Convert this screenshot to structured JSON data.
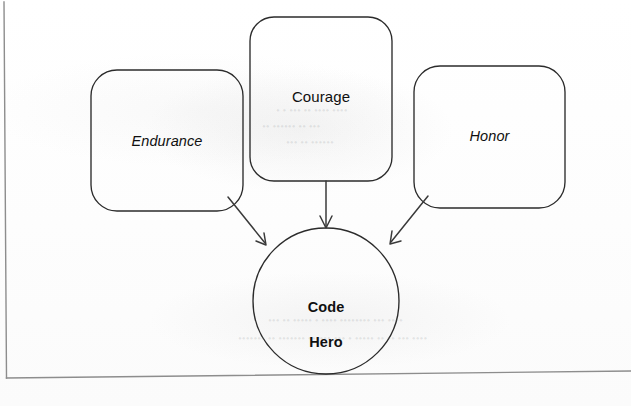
{
  "page": {
    "kind": "scanned-book-figure",
    "width": 631,
    "height": 406,
    "background_color": "#fefefe",
    "ink_color": "#2b2b2b",
    "text_color": "#101010"
  },
  "diagram": {
    "type": "concept-map",
    "title": "",
    "nodes": [
      {
        "id": "endurance",
        "label": "Endurance",
        "shape": "rounded-rectangle",
        "style": "italic",
        "x": 91,
        "y": 70,
        "width": 152,
        "height": 141
      },
      {
        "id": "courage",
        "label": "Courage",
        "shape": "rounded-rectangle",
        "style": "regular",
        "x": 250,
        "y": 17,
        "width": 142,
        "height": 164
      },
      {
        "id": "honor",
        "label": "Honor",
        "shape": "rounded-rectangle",
        "style": "italic",
        "x": 414,
        "y": 66,
        "width": 151,
        "height": 142
      },
      {
        "id": "code-hero",
        "label": "Code\nHero",
        "label_line_1": "Code",
        "label_line_2": "Hero",
        "shape": "circle",
        "style": "bold",
        "cx": 326,
        "cy": 301,
        "r": 73
      }
    ],
    "edges": [
      {
        "id": "endurance-to-code-hero",
        "from": "endurance",
        "to": "code-hero",
        "arrowhead": "open-v",
        "direction": "down-right"
      },
      {
        "id": "courage-to-code-hero",
        "from": "courage",
        "to": "code-hero",
        "arrowhead": "open-v",
        "direction": "down"
      },
      {
        "id": "honor-to-code-hero",
        "from": "honor",
        "to": "code-hero",
        "arrowhead": "open-v",
        "direction": "down-left"
      }
    ],
    "border": {
      "left_rule": true,
      "bottom_rule": true
    }
  },
  "bleed_through": [
    {
      "text": "• • ••• •• •••• ••••",
      "x": 276,
      "y": 112
    },
    {
      "text": "•• •••••• •• •••",
      "x": 262,
      "y": 128
    },
    {
      "text": "••• •• ••••••",
      "x": 286,
      "y": 144
    },
    {
      "text": "••• •• ••••• • •••• •••••••• ••• ••••",
      "x": 268,
      "y": 322
    },
    {
      "text": "••••••• •• ••••••• •••••• ••• • ••••• •• •• ••• ••••",
      "x": 238,
      "y": 340
    }
  ]
}
